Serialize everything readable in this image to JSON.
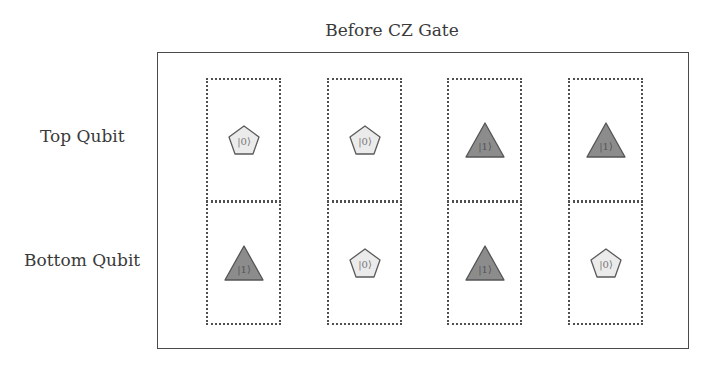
{
  "title": "Before CZ Gate",
  "row_labels": {
    "top": "Top Qubit",
    "bottom": "Bottom Qubit"
  },
  "colors": {
    "zero_fill": "#ebebeb",
    "zero_stroke": "#5a5a5a",
    "one_fill": "#8c8c8c",
    "one_stroke": "#555555",
    "frame": "#4a4a4a",
    "dotted": "#505050"
  },
  "legend_shapes": {
    "zero": "pentagon-icon",
    "one": "triangle-icon"
  },
  "columns": [
    {
      "top": {
        "state": "|0⟩",
        "shape": "pentagon"
      },
      "bottom": {
        "state": "|1⟩",
        "shape": "triangle"
      }
    },
    {
      "top": {
        "state": "|0⟩",
        "shape": "pentagon"
      },
      "bottom": {
        "state": "|0⟩",
        "shape": "pentagon"
      }
    },
    {
      "top": {
        "state": "|1⟩",
        "shape": "triangle"
      },
      "bottom": {
        "state": "|1⟩",
        "shape": "triangle"
      }
    },
    {
      "top": {
        "state": "|1⟩",
        "shape": "triangle"
      },
      "bottom": {
        "state": "|0⟩",
        "shape": "pentagon"
      }
    }
  ]
}
